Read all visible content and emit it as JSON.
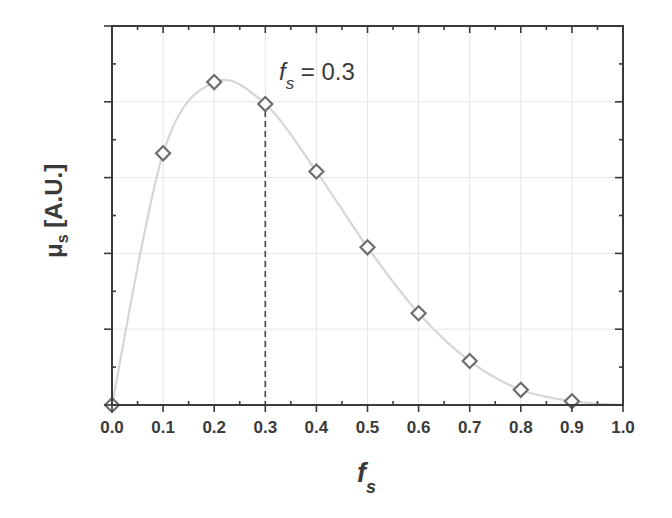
{
  "chart_data": {
    "type": "line",
    "title": "",
    "xlabel": "f_s",
    "xlabel_main": "f",
    "xlabel_sub": "s",
    "ylabel": "μs [A.U.]",
    "ylabel_main": "μ",
    "ylabel_sub": "s",
    "ylabel_units": " [A.U.]",
    "xlim": [
      0.0,
      1.0
    ],
    "ylim": [
      0,
      5
    ],
    "x_ticks": [
      "0.0",
      "0.1",
      "0.2",
      "0.3",
      "0.4",
      "0.5",
      "0.6",
      "0.7",
      "0.8",
      "0.9",
      "1.0"
    ],
    "y_ticks_shown": false,
    "grid": true,
    "legend": null,
    "series": [
      {
        "name": "μs (data points)",
        "style": "open-diamond markers",
        "x": [
          0.0,
          0.1,
          0.2,
          0.3,
          0.4,
          0.5,
          0.6,
          0.7,
          0.8,
          0.9
        ],
        "values": [
          0.0,
          3.32,
          4.26,
          3.97,
          3.08,
          2.08,
          1.21,
          0.58,
          0.2,
          0.05
        ]
      },
      {
        "name": "μs (fit curve)",
        "style": "smooth light-gray line",
        "x": [
          0.0,
          0.1,
          0.2,
          0.3,
          0.4,
          0.5,
          0.6,
          0.7,
          0.8,
          0.9,
          1.0
        ],
        "values": [
          0.0,
          3.32,
          4.26,
          3.97,
          3.08,
          2.08,
          1.21,
          0.58,
          0.2,
          0.05,
          0.0
        ]
      }
    ],
    "annotations": [
      {
        "text": "f_s = 0.3",
        "main": "f",
        "sub": "s",
        "rest": " = 0.3",
        "marker_line": {
          "x": 0.3,
          "style": "dashed vertical line from data point to x-axis"
        }
      }
    ],
    "colors": {
      "axis": "#3a3a3a",
      "curve": "#d6d6d6",
      "marker": "#6e6e6e",
      "grid": "#e6e6e6",
      "dash": "#444444"
    }
  }
}
